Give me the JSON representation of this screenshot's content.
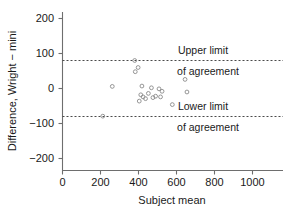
{
  "chart_data": {
    "type": "scatter",
    "title": "",
    "xlabel": "Subject mean",
    "ylabel": "Difference, Wright − mini",
    "xlim": [
      0,
      1180
    ],
    "ylim": [
      -230,
      230
    ],
    "xticks": [
      0,
      200,
      400,
      600,
      800,
      1000
    ],
    "xticklabels": [
      "0",
      "200",
      "400",
      "600",
      "800",
      "1000"
    ],
    "yticks": [
      200,
      100,
      0,
      -100,
      -200
    ],
    "yticklabels": [
      "200",
      "100",
      "0",
      "−100",
      "−200"
    ],
    "grid": false,
    "legend": "none",
    "marker": "open-circle",
    "points": [
      {
        "x": 212,
        "y": -79
      },
      {
        "x": 262,
        "y": 6
      },
      {
        "x": 380,
        "y": 80
      },
      {
        "x": 383,
        "y": 48
      },
      {
        "x": 398,
        "y": 60
      },
      {
        "x": 404,
        "y": -36
      },
      {
        "x": 412,
        "y": -18
      },
      {
        "x": 418,
        "y": 7
      },
      {
        "x": 424,
        "y": -24
      },
      {
        "x": 437,
        "y": -29
      },
      {
        "x": 452,
        "y": -14
      },
      {
        "x": 468,
        "y": 2
      },
      {
        "x": 476,
        "y": -26
      },
      {
        "x": 490,
        "y": -22
      },
      {
        "x": 508,
        "y": -1
      },
      {
        "x": 516,
        "y": -24
      },
      {
        "x": 524,
        "y": -8
      },
      {
        "x": 578,
        "y": -46
      },
      {
        "x": 645,
        "y": 26
      },
      {
        "x": 655,
        "y": -10
      }
    ],
    "reference_lines": [
      {
        "name": "upper-limit-of-agreement",
        "value": 80,
        "style": "dashed"
      },
      {
        "name": "lower-limit-of-agreement",
        "value": -80,
        "style": "dashed"
      }
    ],
    "annotations": [
      {
        "name": "upper-limit-label-line1",
        "text": "Upper limit"
      },
      {
        "name": "upper-limit-label-line2",
        "text": "of agreement"
      },
      {
        "name": "lower-limit-label-line1",
        "text": "Lower limit"
      },
      {
        "name": "lower-limit-label-line2",
        "text": "of agreement"
      }
    ]
  },
  "colors": {
    "axis": "#6e6e6e",
    "text": "#1a1a1a",
    "marker": "#8a8a8a",
    "reference": "#4a4a4a",
    "background": "#ffffff"
  }
}
